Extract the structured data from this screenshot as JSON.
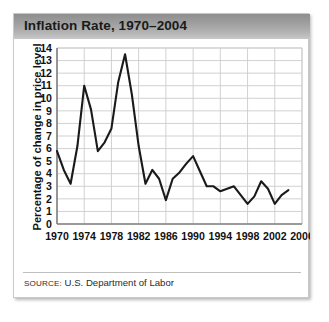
{
  "card": {
    "title": "Inflation Rate, 1970–2004",
    "source_label": "SOURCE:",
    "source_value": "U.S. Department of Labor"
  },
  "colors": {
    "title_bar_dark": "#8e8e8e",
    "title_bar_light": "#c8c8c8",
    "line": "#1a1a1a",
    "grid": "#cccccc",
    "axis": "#808080",
    "card_border": "#c9c9c9"
  },
  "chart_data": {
    "type": "line",
    "title": "Inflation Rate, 1970–2004",
    "xlabel": "",
    "ylabel": "Percentage of change in price level",
    "xlim": [
      1970,
      2006
    ],
    "ylim": [
      0,
      14
    ],
    "grid": true,
    "legend": "none",
    "xticks": [
      1970,
      1974,
      1978,
      1982,
      1986,
      1990,
      1994,
      1998,
      2002,
      2006
    ],
    "yticks": [
      0,
      1,
      2,
      3,
      4,
      5,
      6,
      7,
      8,
      9,
      10,
      11,
      12,
      13,
      14
    ],
    "x": [
      1970,
      1971,
      1972,
      1973,
      1974,
      1975,
      1976,
      1977,
      1978,
      1979,
      1980,
      1981,
      1982,
      1983,
      1984,
      1985,
      1986,
      1987,
      1988,
      1989,
      1990,
      1991,
      1992,
      1993,
      1994,
      1995,
      1996,
      1997,
      1998,
      1999,
      2000,
      2001,
      2002,
      2003,
      2004
    ],
    "series": [
      {
        "name": "Inflation Rate",
        "values": [
          5.8,
          4.3,
          3.2,
          6.2,
          11.0,
          9.1,
          5.8,
          6.5,
          7.6,
          11.3,
          13.5,
          10.3,
          6.2,
          3.2,
          4.3,
          3.6,
          1.9,
          3.6,
          4.1,
          4.8,
          5.4,
          4.2,
          3.0,
          3.0,
          2.6,
          2.8,
          3.0,
          2.3,
          1.6,
          2.2,
          3.4,
          2.8,
          1.6,
          2.3,
          2.7
        ]
      }
    ]
  }
}
